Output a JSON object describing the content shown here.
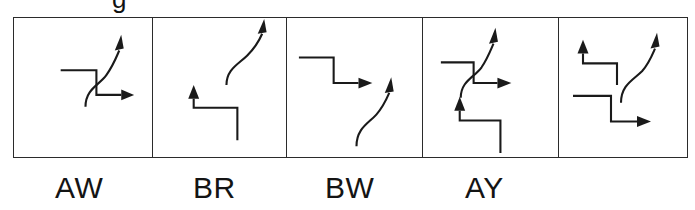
{
  "figure": {
    "kind": "line-drawing-panel-strip",
    "background_color": "#ffffff",
    "stroke_color": "#1a1a1a",
    "border_color": "#2b2b2b",
    "panel_count": 5,
    "clipped_top_text": "g"
  },
  "labels": [
    {
      "text": "AW"
    },
    {
      "text": "BR"
    },
    {
      "text": "BW"
    },
    {
      "text": "AY"
    },
    {
      "text": ""
    }
  ],
  "panels": [
    {
      "name": "panel-aw",
      "label": "AW",
      "glyphs": [
        "horizontal-line-to-corner",
        "vertical-drop",
        "horizontal-arrow-right",
        "s-curve-arrow-up-crossing"
      ]
    },
    {
      "name": "panel-br",
      "label": "BR",
      "glyphs": [
        "s-curve-arrow-up",
        "arrow-up-step-right-down"
      ]
    },
    {
      "name": "panel-bw",
      "label": "BW",
      "glyphs": [
        "step-down-arrow-right",
        "s-curve-arrow-up"
      ]
    },
    {
      "name": "panel-ay",
      "label": "AY",
      "glyphs": [
        "horizontal-line-to-corner",
        "vertical-drop",
        "horizontal-arrow-right",
        "s-curve-arrow-up-crossing",
        "arrow-up-step-right-down"
      ]
    },
    {
      "name": "panel-unlabeled",
      "label": "",
      "glyphs": [
        "arrow-up-step-right-down",
        "s-curve-arrow-up",
        "step-down-arrow-right"
      ]
    }
  ]
}
